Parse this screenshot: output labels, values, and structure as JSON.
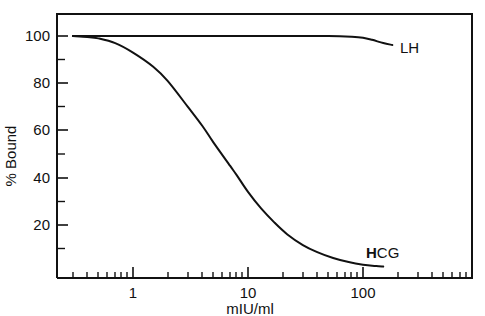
{
  "chart_data": {
    "type": "line",
    "title": "",
    "subtitle": "",
    "xlabel": "mIU/ml",
    "ylabel": "% Bound",
    "xscale": "log",
    "xlim": [
      0.25,
      600
    ],
    "ylim": [
      0,
      108
    ],
    "x_tick_labels": [
      "1",
      "10",
      "100"
    ],
    "x_tick_values": [
      1,
      10,
      100
    ],
    "y_tick_labels": [
      "100",
      "80",
      "60",
      "40",
      "20"
    ],
    "y_tick_values": [
      100,
      80,
      60,
      40,
      20
    ],
    "grid": false,
    "legend_position": "inline-right-of-curve",
    "series": [
      {
        "name": "LH",
        "label": "LH",
        "label_style": "plain",
        "color": "#111111",
        "x": [
          0.3,
          0.5,
          1,
          2,
          5,
          10,
          20,
          50,
          80,
          100,
          120,
          150,
          180
        ],
        "values": [
          100,
          100,
          100,
          100,
          100,
          100,
          100,
          100,
          99.7,
          99.3,
          98.4,
          97.0,
          96.2
        ]
      },
      {
        "name": "HCG",
        "label": "HCG",
        "label_style": "first-letter-bold",
        "color": "#111111",
        "x": [
          0.3,
          0.4,
          0.5,
          0.7,
          1,
          1.5,
          2,
          3,
          4,
          5,
          7,
          8,
          10,
          13,
          17,
          22,
          30,
          40,
          55,
          75,
          100,
          130,
          150
        ],
        "values": [
          100,
          99.6,
          99,
          97,
          93,
          87,
          81,
          70,
          62,
          55,
          45,
          41,
          34,
          27,
          21,
          16,
          11.5,
          8.5,
          6.0,
          4.3,
          3.2,
          2.6,
          2.4
        ]
      }
    ],
    "annotations": [
      {
        "name": "lh-curve-label",
        "text": "LH",
        "x_px": 400,
        "y_px": 53
      },
      {
        "name": "hcg-curve-label",
        "text": "HCG",
        "x_px": 366,
        "y_px": 258
      }
    ]
  },
  "axes": {
    "y": {
      "title": "% Bound",
      "ticks": [
        {
          "label": "100",
          "value": 100
        },
        {
          "label": "80",
          "value": 80
        },
        {
          "label": "60",
          "value": 60
        },
        {
          "label": "40",
          "value": 40
        },
        {
          "label": "20",
          "value": 20
        }
      ]
    },
    "x": {
      "title": "mIU/ml",
      "ticks": [
        {
          "label": "1",
          "value": 1
        },
        {
          "label": "10",
          "value": 10
        },
        {
          "label": "100",
          "value": 100
        }
      ]
    }
  },
  "labels": {
    "lh": "LH",
    "hcg_bold_part": "H",
    "hcg_rest_part": "CG"
  },
  "colors": {
    "ink": "#111111",
    "background": "#ffffff"
  }
}
